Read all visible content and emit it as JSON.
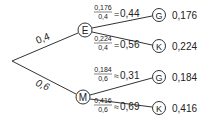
{
  "tree": {
    "root_branches": [
      {
        "prob": "0,4",
        "node": "E"
      },
      {
        "prob": "0,6",
        "node": "M"
      }
    ],
    "leaves": [
      {
        "parent": "E",
        "num": "0,176",
        "den": "0,4",
        "rel": "=",
        "cond": "0,44",
        "node": "G",
        "joint": "0,176"
      },
      {
        "parent": "E",
        "num": "0,224",
        "den": "0,4",
        "rel": "=",
        "cond": "0,56",
        "node": "K",
        "joint": "0,224"
      },
      {
        "parent": "M",
        "num": "0,184",
        "den": "0,6",
        "rel": "≈",
        "cond": "0,31",
        "node": "G",
        "joint": "0,184"
      },
      {
        "parent": "M",
        "num": "0,416",
        "den": "0,6",
        "rel": "≈",
        "cond": "0,69",
        "node": "K",
        "joint": "0,416"
      }
    ]
  }
}
